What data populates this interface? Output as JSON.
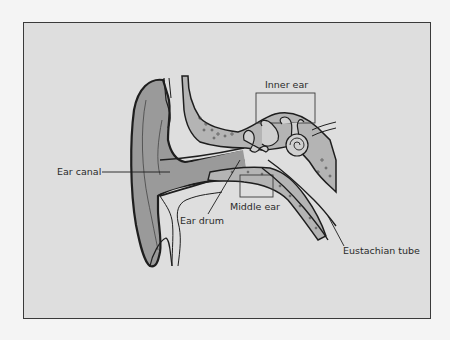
{
  "diagram": {
    "colors": {
      "background": "#dedede",
      "frame_border": "#3a3a3a",
      "tissue_fill": "#9a9a9a",
      "bone_fill": "#b4b4b4",
      "outline": "#1e1e1e"
    },
    "labels": {
      "inner_ear": "Inner ear",
      "ear_canal": "Ear canal",
      "middle_ear": "Middle ear",
      "ear_drum": "Ear drum",
      "eustachian_tube": "Eustachian tube"
    }
  }
}
